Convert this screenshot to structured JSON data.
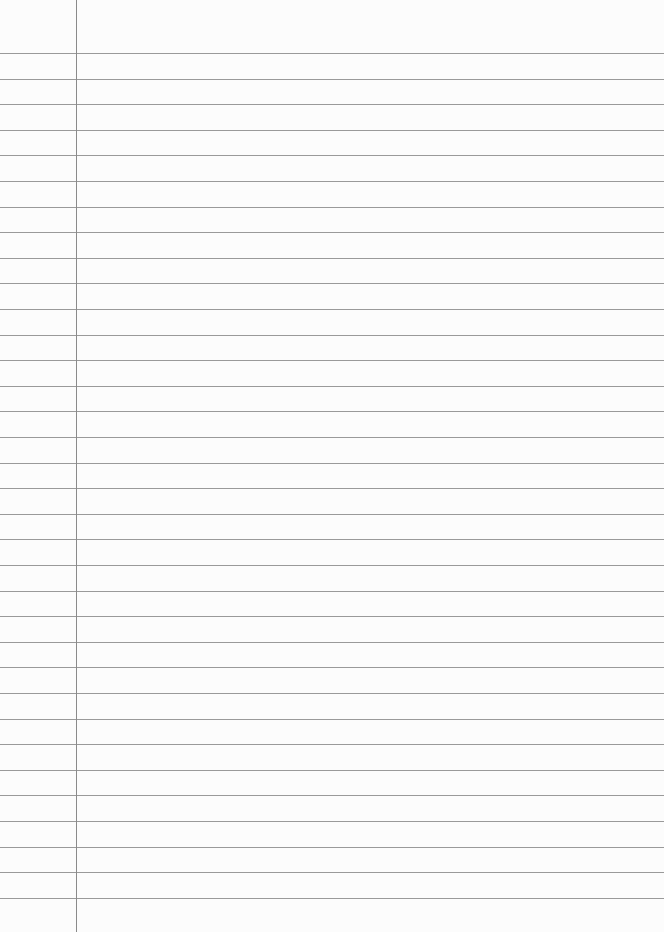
{
  "page": {
    "type": "ruled-notebook-page",
    "width": 664,
    "height": 932,
    "background": "#fcfcfc",
    "rule_color": "#9a9a9a",
    "margin_color": "#8a8a8a",
    "margin_x": 76,
    "first_rule_y": 53,
    "rule_spacing": 25.6,
    "rule_count": 34
  }
}
